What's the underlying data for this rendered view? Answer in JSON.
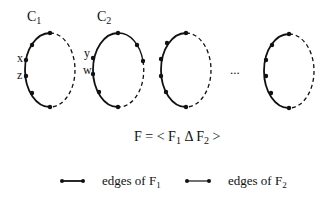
{
  "diagram": {
    "cycles": [
      {
        "label": "C",
        "sub": "1",
        "cx": 50,
        "cy": 70,
        "rx": 25,
        "ry": 37,
        "vertex_labels": [
          {
            "text": "x",
            "x": 18,
            "y": 58
          },
          {
            "text": "z",
            "x": 18,
            "y": 76
          }
        ]
      },
      {
        "label": "C",
        "sub": "2",
        "cx": 118,
        "cy": 70,
        "rx": 25,
        "ry": 37,
        "vertex_labels": [
          {
            "text": "y",
            "x": 86,
            "y": 58
          },
          {
            "text": "w",
            "x": 85,
            "y": 76
          }
        ]
      },
      {
        "label": "",
        "sub": "",
        "cx": 181,
        "cy": 70,
        "rx": 25,
        "ry": 37,
        "vertex_labels": []
      },
      {
        "label": "",
        "sub": "",
        "cx": 290,
        "cy": 71,
        "rx": 25,
        "ry": 37,
        "vertex_labels": []
      }
    ],
    "ellipsis": "...",
    "formula": {
      "F": "F",
      "eq": " = < ",
      "F1": "F",
      "sub1": "1",
      "delta": " Δ ",
      "F2": "F",
      "sub2": "2",
      "close": " >"
    },
    "legend": [
      {
        "style": "thick",
        "text": "edges of F",
        "sub": "1"
      },
      {
        "style": "thin",
        "text": "edges of F",
        "sub": "2"
      }
    ]
  }
}
